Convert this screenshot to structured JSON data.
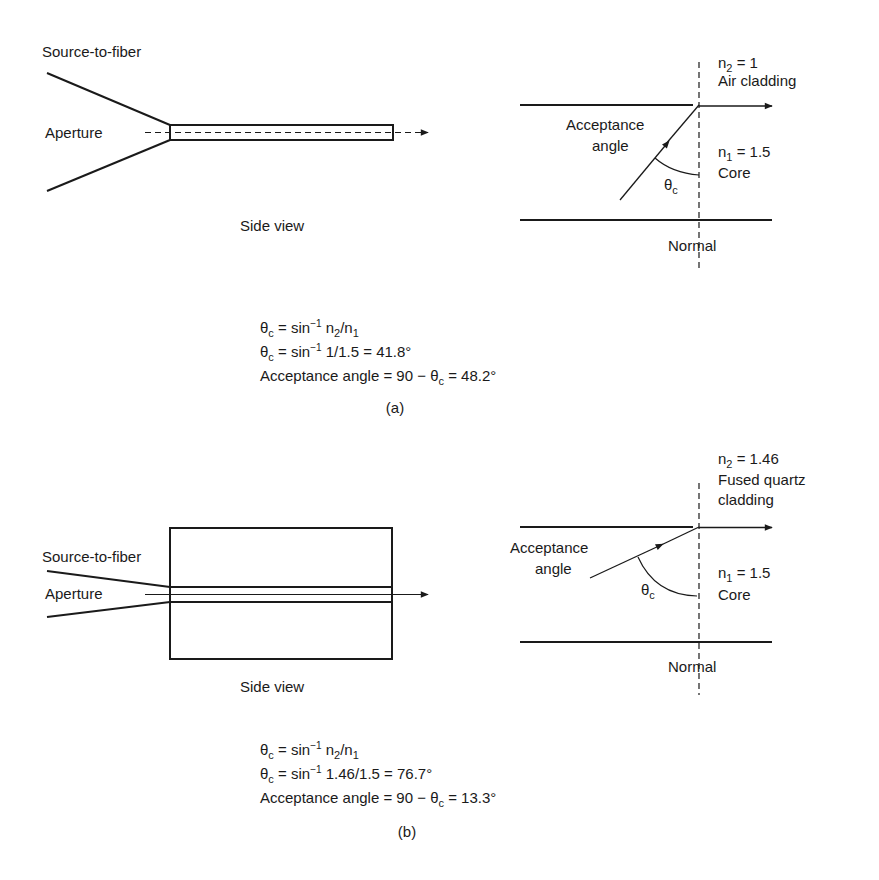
{
  "panel_a": {
    "side_view": {
      "source_label": "Source-to-fiber",
      "aperture_label": "Aperture",
      "caption": "Side view"
    },
    "interface": {
      "n2_label": "n",
      "n2_sub": "2",
      "n2_value": " = 1",
      "cladding_label": "Air cladding",
      "acceptance_line1": "Acceptance",
      "acceptance_line2": "angle",
      "n1_label": "n",
      "n1_sub": "1",
      "n1_value": " = 1.5",
      "core_label": "Core",
      "theta_label": "θ",
      "theta_sub": "c",
      "normal_label": "Normal"
    },
    "equations": {
      "eq1": {
        "theta": "θ",
        "sub": "c",
        "mid": " = sin",
        "sup": "−1",
        "rest_a": " n",
        "sub2": "2",
        "rest_b": "/n",
        "sub3": "1"
      },
      "eq2": {
        "theta": "θ",
        "sub": "c",
        "mid": " = sin",
        "sup": "−1",
        "rest": " 1/1.5 = 41.8°"
      },
      "eq3": {
        "start": "Acceptance angle = 90 − θ",
        "sub": "c",
        "rest": " = 48.2°"
      }
    },
    "caption": "(a)"
  },
  "panel_b": {
    "side_view": {
      "source_label": "Source-to-fiber",
      "aperture_label": "Aperture",
      "caption": "Side view"
    },
    "interface": {
      "n2_label": "n",
      "n2_sub": "2",
      "n2_value": " = 1.46",
      "cladding_line1": "Fused quartz",
      "cladding_line2": "cladding",
      "acceptance_line1": "Acceptance",
      "acceptance_line2": "angle",
      "n1_label": "n",
      "n1_sub": "1",
      "n1_value": " = 1.5",
      "core_label": "Core",
      "theta_label": "θ",
      "theta_sub": "c",
      "normal_label": "Normal"
    },
    "equations": {
      "eq1": {
        "theta": "θ",
        "sub": "c",
        "mid": " = sin",
        "sup": "−1",
        "rest_a": " n",
        "sub2": "2",
        "rest_b": "/n",
        "sub3": "1"
      },
      "eq2": {
        "theta": "θ",
        "sub": "c",
        "mid": " = sin",
        "sup": "−1",
        "rest": " 1.46/1.5 = 76.7°"
      },
      "eq3": {
        "start": "Acceptance angle = 90 − θ",
        "sub": "c",
        "rest": " = 13.3°"
      }
    },
    "caption": "(b)"
  },
  "colors": {
    "line": "#1a1a1a",
    "background": "#ffffff"
  }
}
